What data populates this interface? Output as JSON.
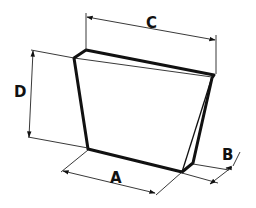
{
  "diagram": {
    "type": "dimension drawing",
    "colors": {
      "line": "#111111",
      "background": "#ffffff"
    },
    "dimensions": [
      {
        "id": "A",
        "label": "A",
        "meaning": "bottom width"
      },
      {
        "id": "B",
        "label": "B",
        "meaning": "thickness"
      },
      {
        "id": "C",
        "label": "C",
        "meaning": "top width"
      },
      {
        "id": "D",
        "label": "D",
        "meaning": "height"
      }
    ]
  }
}
